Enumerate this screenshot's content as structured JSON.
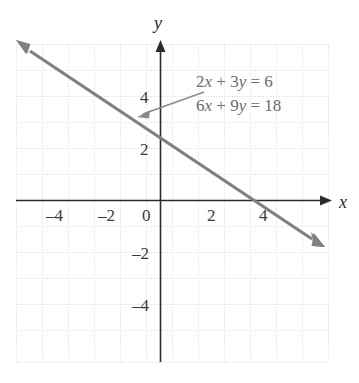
{
  "figure": {
    "type": "coordinate-plane-graph",
    "background_color": "#ffffff",
    "grid_color": "#d8d8d8",
    "axis_color": "#2b2b2b",
    "line_color": "#808080",
    "label_color": "#3a3a3a",
    "equation_color": "#6b6b6b"
  },
  "axes": {
    "x_axis_label": "x",
    "y_axis_label": "y",
    "x_ticks": [
      {
        "value": -4,
        "label": "–4"
      },
      {
        "value": -2,
        "label": "–2"
      },
      {
        "value": 0,
        "label": "0"
      },
      {
        "value": 2,
        "label": "2"
      },
      {
        "value": 4,
        "label": "4"
      }
    ],
    "y_ticks": [
      {
        "value": 4,
        "label": "4"
      },
      {
        "value": 2,
        "label": "2"
      },
      {
        "value": -2,
        "label": "–2"
      },
      {
        "value": -4,
        "label": "–4"
      }
    ]
  },
  "equations": {
    "first": {
      "lhs_a": "2",
      "lhs_x": "x",
      "plus": "+",
      "lhs_b": "3",
      "lhs_y": "y",
      "eq": "=",
      "rhs": "6",
      "text": "2x + 3y = 6"
    },
    "second": {
      "lhs_a": "6",
      "lhs_x": "x",
      "plus": "+",
      "lhs_b": "9",
      "lhs_y": "y",
      "eq": "=",
      "rhs": "18",
      "text": "6x + 9y = 18"
    }
  },
  "chart_data": {
    "type": "line",
    "title": "",
    "xlabel": "x",
    "ylabel": "y",
    "grid": true,
    "legend": "annotation-callout",
    "xlim": [
      -5.5,
      6.5
    ],
    "ylim": [
      -6.2,
      5.6
    ],
    "xticks": [
      -4,
      -2,
      0,
      2,
      4
    ],
    "yticks": [
      -4,
      -2,
      2,
      4
    ],
    "annotations": [
      {
        "text": "2x + 3y = 6",
        "target_x": -0.8,
        "target_y": 2.53,
        "leader": true
      },
      {
        "text": "6x + 9y = 18",
        "target_x": -0.8,
        "target_y": 2.53,
        "leader": false
      }
    ],
    "series": [
      {
        "name": "2x + 3y = 6 / 6x + 9y = 18",
        "equation": "y = 2 - (2/3)x",
        "slope": -0.6667,
        "intercept": 2,
        "x_intercept": 3,
        "y_intercept": 2,
        "arrows": "both",
        "x": [
          -5.4,
          6.15
        ],
        "y": [
          5.6,
          -2.1
        ],
        "points": [
          {
            "x": -3,
            "y": 4
          },
          {
            "x": 0,
            "y": 2
          },
          {
            "x": 3,
            "y": 0
          },
          {
            "x": 6,
            "y": -2
          }
        ]
      }
    ]
  }
}
